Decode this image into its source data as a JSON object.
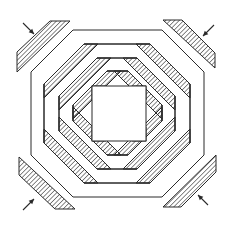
{
  "figure": {
    "frame_count": 4,
    "center": "square",
    "corner_strips": [
      {
        "position": "top-left",
        "arrow_direction": "down-right"
      },
      {
        "position": "top-right",
        "arrow_direction": "down-left"
      },
      {
        "position": "bottom-left",
        "arrow_direction": "up-right"
      },
      {
        "position": "bottom-right",
        "arrow_direction": "up-left"
      }
    ],
    "colors": {
      "line": "#2a2a2a",
      "background": "#ffffff",
      "hatch": "#2a2a2a"
    }
  }
}
